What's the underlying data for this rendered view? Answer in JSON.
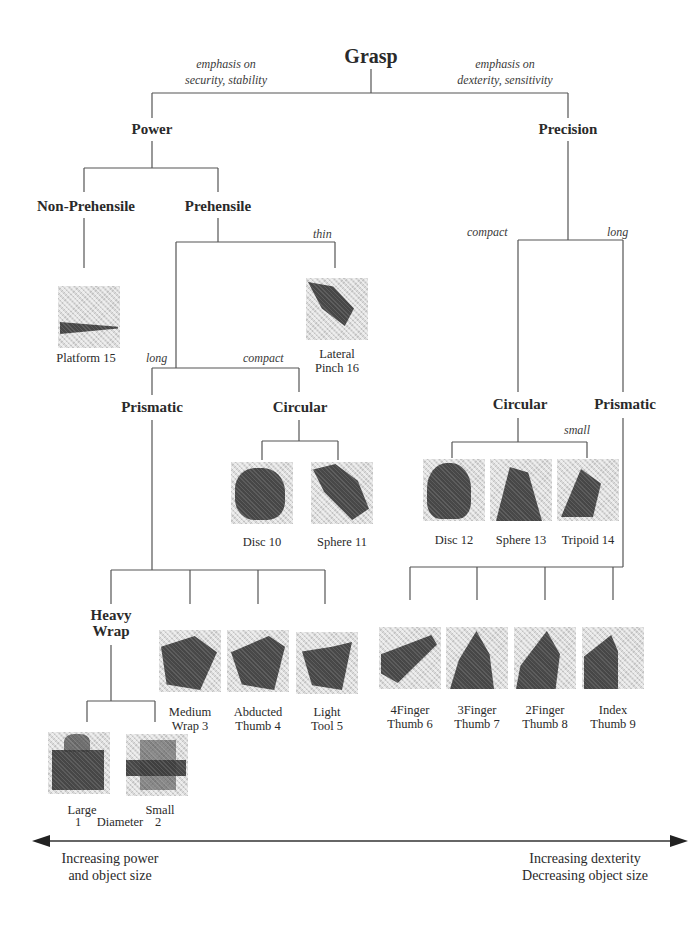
{
  "title": "Grasp",
  "branch_annotations": {
    "left": [
      "emphasis on",
      "security, stability"
    ],
    "right": [
      "emphasis on",
      "dexterity, sensitivity"
    ]
  },
  "nodes": {
    "power": "Power",
    "precision": "Precision",
    "non_prehensile": "Non-Prehensile",
    "prehensile": "Prehensile",
    "power_prismatic": "Prismatic",
    "power_circular": "Circular",
    "heavy_wrap": [
      "Heavy",
      "Wrap"
    ],
    "precision_circular": "Circular",
    "precision_prismatic": "Prismatic"
  },
  "edge_labels": {
    "thin": "thin",
    "power_long": "long",
    "power_compact": "compact",
    "precision_compact": "compact",
    "precision_long": "long",
    "small": "small"
  },
  "grasps": [
    {
      "id": 15,
      "lines": [
        "Platform 15"
      ]
    },
    {
      "id": 16,
      "lines": [
        "Lateral",
        "Pinch 16"
      ]
    },
    {
      "id": 10,
      "lines": [
        "Disc 10"
      ]
    },
    {
      "id": 11,
      "lines": [
        "Sphere 11"
      ]
    },
    {
      "id": 12,
      "lines": [
        "Disc 12"
      ]
    },
    {
      "id": 13,
      "lines": [
        "Sphere 13"
      ]
    },
    {
      "id": 14,
      "lines": [
        "Tripoid 14"
      ]
    },
    {
      "id": 3,
      "lines": [
        "Medium",
        "Wrap 3"
      ]
    },
    {
      "id": 4,
      "lines": [
        "Abducted",
        "Thumb 4"
      ]
    },
    {
      "id": 5,
      "lines": [
        "Light",
        "Tool 5"
      ]
    },
    {
      "id": 6,
      "lines": [
        "4Finger",
        "Thumb 6"
      ]
    },
    {
      "id": 7,
      "lines": [
        "3Finger",
        "Thumb 7"
      ]
    },
    {
      "id": 8,
      "lines": [
        "2Finger",
        "Thumb 8"
      ]
    },
    {
      "id": 9,
      "lines": [
        "Index",
        "Thumb 9"
      ]
    },
    {
      "id": 1,
      "lines": [
        "Large",
        "1"
      ]
    },
    {
      "id": 2,
      "lines": [
        "Small",
        "2"
      ]
    }
  ],
  "diameter_label": "Diameter",
  "axis": {
    "left": [
      "Increasing power",
      "and object size"
    ],
    "right": [
      "Increasing dexterity",
      "Decreasing object size"
    ]
  }
}
